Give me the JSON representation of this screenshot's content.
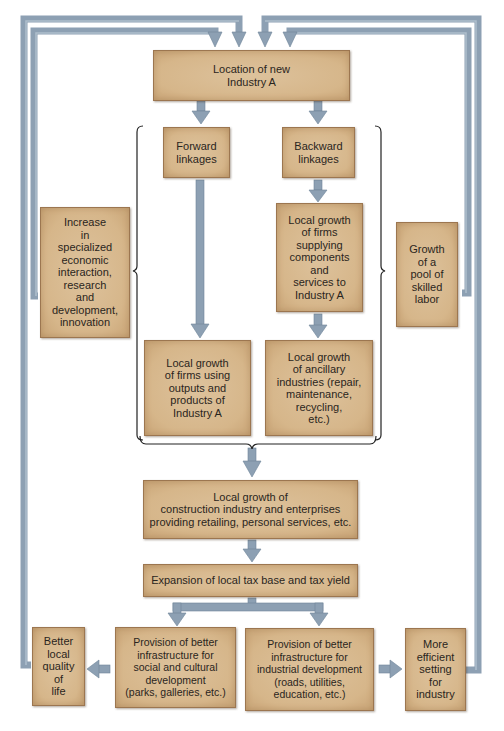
{
  "diagram": {
    "colors": {
      "box_fill": "#d9bb91",
      "box_border": "#9c7650",
      "arrow": "#8da0b3",
      "arrow_edge": "#6f8499",
      "brace": "#222222",
      "text": "#2a2520"
    },
    "nodes": {
      "location": "Location of new\nIndustry A",
      "forward": "Forward\nlinkages",
      "backward": "Backward\nlinkages",
      "supplying": "Local growth\nof firms\nsupplying\ncomponents\nand\nservices to\nIndustry A",
      "increase": "Increase\nin\nspecialized\neconomic\ninteraction,\nresearch\nand\ndevelopment,\ninnovation",
      "skilled": "Growth\nof a\npool of\nskilled\nlabor",
      "outputs": "Local growth\nof firms using\noutputs and\nproducts of\nIndustry A",
      "ancillary": "Local growth\nof ancillary\nindustries (repair,\nmaintenance,\nrecycling,\netc.)",
      "construction": "Local growth of\nconstruction industry and enterprises\nproviding retailing, personal services, etc.",
      "tax": "Expansion of local tax base and tax yield",
      "quality": "Better\nlocal\nquality\nof\nlife",
      "social": "Provision of better\ninfrastructure for\nsocial and cultural\ndevelopment\n(parks, galleries, etc.)",
      "industrial": "Provision of better\ninfrastructure for\nindustrial development\n(roads, utilities,\neducation, etc.)",
      "efficient": "More\nefficient\nsetting\nfor\nindustry"
    },
    "edges": [
      {
        "from": "location",
        "to": "forward"
      },
      {
        "from": "location",
        "to": "backward"
      },
      {
        "from": "backward",
        "to": "supplying"
      },
      {
        "from": "supplying",
        "to": "ancillary"
      },
      {
        "from": "forward",
        "to": "outputs"
      },
      {
        "from": "linkages-group",
        "to": "construction"
      },
      {
        "from": "construction",
        "to": "tax"
      },
      {
        "from": "tax",
        "to": "social"
      },
      {
        "from": "tax",
        "to": "industrial"
      },
      {
        "from": "social",
        "to": "quality"
      },
      {
        "from": "industrial",
        "to": "efficient"
      },
      {
        "from": "quality",
        "to": "location"
      },
      {
        "from": "increase",
        "to": "location"
      },
      {
        "from": "skilled",
        "to": "location"
      },
      {
        "from": "efficient",
        "to": "location"
      }
    ]
  }
}
